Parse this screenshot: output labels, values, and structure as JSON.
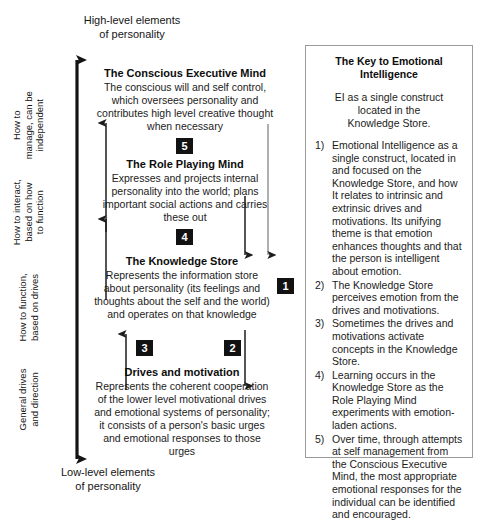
{
  "axis": {
    "top_caption": "High-level elements\nof personality",
    "bottom_caption": "Low-level elements\nof personality",
    "range_labels": [
      {
        "text": "How to\nmanage, can be\nindependent"
      },
      {
        "text": "How to interact,\nbased on how\nto function"
      },
      {
        "text": "How to function,\nbased on drives"
      },
      {
        "text": "General drives\nand direction"
      }
    ]
  },
  "nodes": [
    {
      "title": "The Conscious Executive Mind",
      "body": "The conscious will and self control, which oversees personality and contributes high level creative thought when necessary"
    },
    {
      "title": "The Role Playing Mind",
      "body": "Expresses and projects internal personality into the world; plans important social actions and carries these out"
    },
    {
      "title": "The Knowledge Store",
      "body": "Represents the information store about personality (its feelings and thoughts about the self and the world) and operates on that knowledge"
    },
    {
      "title": "Drives and motivation",
      "body": "Represents the coherent cooperation of the lower level motivational drives and emotional systems of personality; it consists of a person's basic urges and emotional responses to those urges"
    }
  ],
  "chips": [
    {
      "label": "5"
    },
    {
      "label": "4"
    },
    {
      "label": "3"
    },
    {
      "label": "2"
    },
    {
      "label": "1"
    }
  ],
  "key_panel": {
    "title": "The Key to Emotional Intelligence",
    "subtitle": "EI as a single construct\nlocated in the\nKnowledge Store.",
    "items": [
      {
        "num": "1)",
        "text": "Emotional Intelligence as a single construct, located in and focused on the Knowledge Store, and how It relates to intrinsic and extrinsic drives and motivations. Its unifying theme is that emotion enhances thoughts and that the person is intelligent about emotion."
      },
      {
        "num": "2)",
        "text": "The Knowledge Store perceives emotion from the drives and motivations."
      },
      {
        "num": "3)",
        "text": "Sometimes the drives and motivations activate concepts in the Knowledge Store."
      },
      {
        "num": "4)",
        "text": "Learning occurs in the Knowledge Store as the Role Playing Mind experiments with emotion-laden actions."
      },
      {
        "num": "5)",
        "text": "Over time, through attempts at self management from the Conscious Executive Mind, the most appropriate emotional responses for the individual can be identified and encouraged."
      }
    ]
  },
  "colors": {
    "ink": "#1b1b1b",
    "chip_bg": "#121212",
    "chip_fg": "#ffffff",
    "panel_border": "#9a9a9a",
    "arrow_dark": "#141414",
    "arrow_thin": "#2a2a2a",
    "arrow_grey": "#8d8d8d"
  }
}
